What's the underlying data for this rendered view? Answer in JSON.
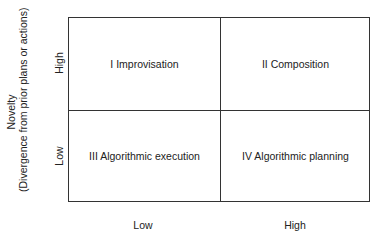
{
  "diagram": {
    "type": "2x2 matrix",
    "y_axis": {
      "title": "Novelty",
      "subtitle": "(Divergence from prior plans or actions)",
      "ticks": [
        "High",
        "Low"
      ]
    },
    "x_axis": {
      "title": "",
      "ticks": [
        "Low",
        "High"
      ]
    },
    "quadrants": [
      {
        "position": "top-left",
        "label": "I Improvisation"
      },
      {
        "position": "top-right",
        "label": "II Composition"
      },
      {
        "position": "bottom-left",
        "label": "III Algorithmic execution"
      },
      {
        "position": "bottom-right",
        "label": "IV Algorithmic planning"
      }
    ],
    "line_color": "#333333"
  }
}
